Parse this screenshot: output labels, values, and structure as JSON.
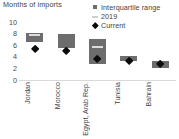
{
  "chart_data": {
    "type": "bar",
    "title": "Months of imports",
    "subtitle": "",
    "xlabel": "",
    "ylabel": "Months of imports",
    "ylim": [
      0,
      10
    ],
    "yticks": [
      10,
      8,
      6,
      4,
      2,
      0
    ],
    "grid": false,
    "legend_position": "top-right",
    "categories": [
      "Jordan",
      "Morocco",
      "Egypt, Arab Rep.",
      "Tunisia",
      "Bahrain"
    ],
    "series": [
      {
        "name": "Interquartile range",
        "type": "range-box",
        "low": [
          6.4,
          5.4,
          2.7,
          3.2,
          2.0
        ],
        "high": [
          7.9,
          7.8,
          7.0,
          4.0,
          3.3
        ]
      },
      {
        "name": "2019",
        "type": "marker-line",
        "values": [
          7.6,
          null,
          5.6,
          null,
          null
        ]
      },
      {
        "name": "Current",
        "type": "marker-diamond",
        "values": [
          5.3,
          4.8,
          3.5,
          3.2,
          2.6
        ]
      }
    ],
    "colors": {
      "box": "#6d6d6d",
      "median_line": "#dcdcdc",
      "current_marker": "#0b0b0b",
      "axis": "#d9d9d9",
      "text": "#3f3f3f"
    }
  },
  "legend": {
    "items": [
      {
        "label": "Interquartile range",
        "swatch": "square-swatch"
      },
      {
        "label": "2019",
        "swatch": "line-swatch"
      },
      {
        "label": "Current",
        "swatch": "diamond-swatch"
      }
    ]
  },
  "axis": {
    "y_tick_labels": [
      "10",
      "8",
      "6",
      "4",
      "2",
      "0"
    ]
  }
}
